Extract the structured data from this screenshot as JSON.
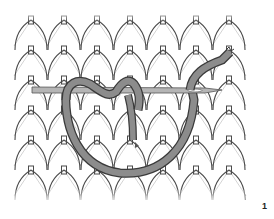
{
  "figure": {
    "label": "1",
    "colors": {
      "background": "#ffffff",
      "fabric_stroke": "#4a4a4a",
      "yarn_fill": "#8c8c8c",
      "yarn_stroke": "#3a3a3a",
      "needle_fill": "#b5b5b5"
    },
    "fabric": {
      "columns": 7,
      "rows": 6
    }
  }
}
